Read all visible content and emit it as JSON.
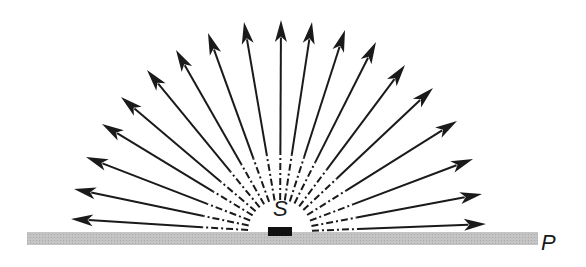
{
  "labels": {
    "source": "S",
    "plate": "P"
  },
  "colors": {
    "ray": "#1a1a1a",
    "plate": "#bdbdbd",
    "source": "#111111",
    "background": "#ffffff"
  },
  "origin": [
    280,
    232
  ],
  "inner_radius": 32,
  "dash_end_radius": 78,
  "ray_tips": [
    [
      71,
      219
    ],
    [
      74,
      189
    ],
    [
      86,
      157
    ],
    [
      102,
      124
    ],
    [
      121,
      97
    ],
    [
      147,
      70
    ],
    [
      176,
      50
    ],
    [
      208,
      33
    ],
    [
      244,
      22
    ],
    [
      281,
      20
    ],
    [
      312,
      22
    ],
    [
      345,
      30
    ],
    [
      376,
      42
    ],
    [
      405,
      65
    ],
    [
      433,
      88
    ],
    [
      457,
      121
    ],
    [
      473,
      159
    ],
    [
      482,
      194
    ],
    [
      486,
      224
    ]
  ],
  "plate": {
    "x": 27,
    "y": 232,
    "width": 511,
    "height": 13
  },
  "source_box": {
    "x": 268,
    "y": 227,
    "width": 24,
    "height": 9
  }
}
